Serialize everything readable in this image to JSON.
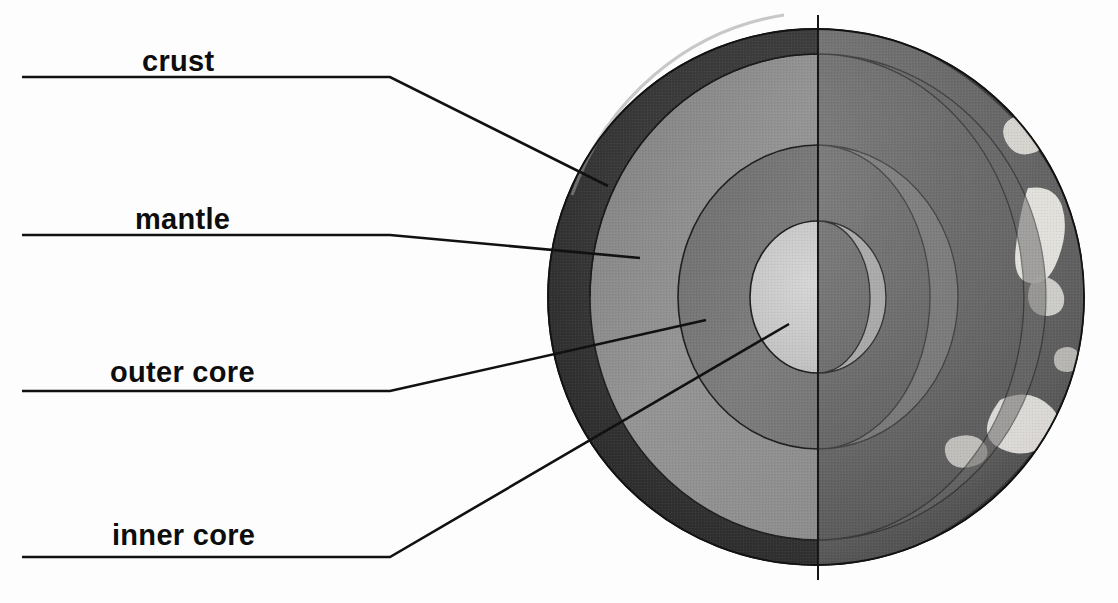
{
  "diagram": {
    "background_color": "#fdfdfd",
    "line_color": "#111111",
    "labels": [
      {
        "id": "crust",
        "text": "crust",
        "leader_bend_x": 390,
        "leader_y": 77,
        "tip_x": 608,
        "tip_y": 186
      },
      {
        "id": "mantle",
        "text": "mantle",
        "leader_bend_x": 390,
        "leader_y": 235,
        "tip_x": 640,
        "tip_y": 258
      },
      {
        "id": "outer-core",
        "text": "outer core",
        "leader_bend_x": 390,
        "leader_y": 391,
        "tip_x": 706,
        "tip_y": 320
      },
      {
        "id": "inner-core",
        "text": "inner core",
        "leader_bend_x": 390,
        "leader_y": 557,
        "tip_x": 789,
        "tip_y": 324
      }
    ],
    "rule_start_x": 22,
    "globe": {
      "center_x": 816,
      "center_y": 297,
      "radius": 268,
      "cut_plane_x": 818,
      "layers": [
        {
          "name": "crust",
          "color": "#3b3b3b",
          "rx": 268,
          "ry": 283
        },
        {
          "name": "mantle",
          "color": "#8c8c8c",
          "rx": 228,
          "ry": 243
        },
        {
          "name": "outer-core",
          "color": "#767676",
          "rx": 140,
          "ry": 152
        },
        {
          "name": "inner-core",
          "color": "#c9c9c9",
          "rx": 68,
          "ry": 76
        }
      ],
      "surface_color": "#6e6e6e",
      "surface_shadow_color": "#4a4a4a",
      "continent_color": "#e6e4df"
    }
  }
}
